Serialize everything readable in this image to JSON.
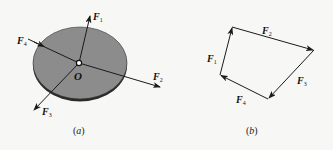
{
  "figure_a": {
    "caption_open": "(",
    "caption_letter": "a",
    "caption_close": ")",
    "center_label": "O",
    "disc_color": "#8c8c8c",
    "disc_shadow_color": "#2a2a2a",
    "forces": [
      {
        "name": "F",
        "sub": "1",
        "direction": "up-right"
      },
      {
        "name": "F",
        "sub": "2",
        "direction": "right-down"
      },
      {
        "name": "F",
        "sub": "3",
        "direction": "down-left"
      },
      {
        "name": "F",
        "sub": "4",
        "direction": "up-left"
      }
    ]
  },
  "figure_b": {
    "caption_open": "(",
    "caption_letter": "b",
    "caption_close": ")",
    "polygon_sides": [
      {
        "name": "F",
        "sub": "1"
      },
      {
        "name": "F",
        "sub": "2"
      },
      {
        "name": "F",
        "sub": "3"
      },
      {
        "name": "F",
        "sub": "4"
      }
    ]
  },
  "colors": {
    "background": "#f7f7f5",
    "line": "#1a1a1a"
  }
}
